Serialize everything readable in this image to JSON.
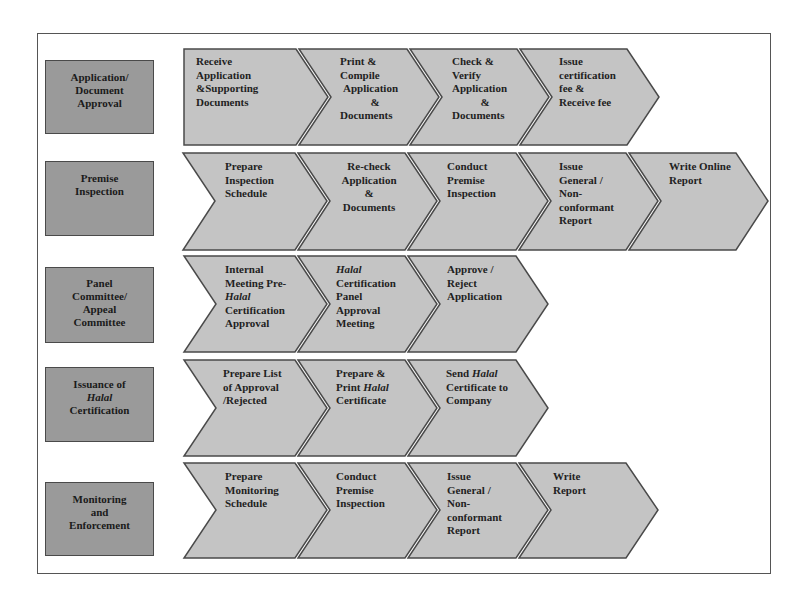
{
  "diagram": {
    "stages": [
      {
        "label": "Application/ Document Approval",
        "lines": [
          "Application/",
          "Document",
          "Approval"
        ],
        "steps": [
          {
            "lines": [
              "Receive",
              "Application",
              "&Supporting",
              "Documents"
            ]
          },
          {
            "lines": [
              "Print &",
              "Compile",
              " Application",
              "&",
              "Documents"
            ]
          },
          {
            "lines": [
              "Check &",
              "Verify",
              "Application",
              "&",
              "Documents"
            ]
          },
          {
            "lines": [
              "Issue",
              "certification",
              "fee &",
              "Receive fee"
            ]
          }
        ]
      },
      {
        "label": "Premise Inspection",
        "lines": [
          "Premise",
          "Inspection"
        ],
        "steps": [
          {
            "lines": [
              "Prepare",
              "Inspection",
              "Schedule"
            ]
          },
          {
            "lines": [
              "Re-check",
              "Application",
              "&",
              "Documents"
            ]
          },
          {
            "lines": [
              "Conduct",
              "Premise",
              "Inspection"
            ]
          },
          {
            "lines": [
              "Issue",
              "General /",
              "Non-",
              "conformant",
              "Report"
            ]
          },
          {
            "lines": [
              "Write Online",
              "Report"
            ]
          }
        ]
      },
      {
        "label": "Panel Committee/ Appeal Committee",
        "lines": [
          "Panel",
          "Committee/",
          "Appeal",
          "Committee"
        ],
        "steps": [
          {
            "lines": [
              "Internal",
              "Meeting Pre-",
              "Halal",
              "Certification",
              "Approval"
            ]
          },
          {
            "lines": [
              "Halal",
              "Certification",
              "Panel",
              "Approval",
              "Meeting"
            ]
          },
          {
            "lines": [
              "Approve /",
              "Reject",
              "Application"
            ]
          }
        ]
      },
      {
        "label": "Issuance of Halal Certification",
        "lines": [
          "Issuance of",
          "Halal",
          "Certification"
        ],
        "steps": [
          {
            "lines": [
              "Prepare List",
              "of Approval",
              "/Rejected"
            ]
          },
          {
            "lines": [
              "Prepare &",
              "Print Halal",
              "Certificate"
            ]
          },
          {
            "lines": [
              "Send Halal",
              "Certificate to",
              "Company"
            ]
          }
        ]
      },
      {
        "label": "Monitoring and Enforcement",
        "lines": [
          "Monitoring",
          "and",
          "Enforcement"
        ],
        "steps": [
          {
            "lines": [
              "Prepare",
              "Monitoring",
              "Schedule"
            ]
          },
          {
            "lines": [
              "Conduct",
              "Premise",
              "Inspection"
            ]
          },
          {
            "lines": [
              "Issue",
              "General /",
              "Non-",
              "conformant",
              "Report"
            ]
          },
          {
            "lines": [
              "Write",
              "Report"
            ]
          }
        ]
      }
    ],
    "italic_word": "Halal",
    "colors": {
      "stage_box_fill": "#9a9a9a",
      "chevron_fill": "#c4c4c4",
      "outline": "#4a4a4a",
      "text": "#1f1f1f"
    }
  }
}
